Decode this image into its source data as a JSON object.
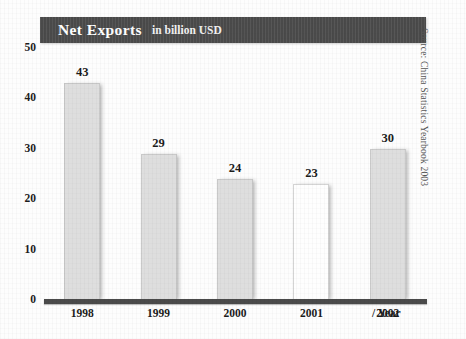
{
  "title": {
    "main": "Net Exports",
    "subtitle": "in billion USD"
  },
  "source_note": "Source: China Statistics Yearbook 2003",
  "x_axis_caption": "/  Year",
  "colors": {
    "banner": "#4e4e4e",
    "bar_gray": "#dedede",
    "bar_white": "#fefefe",
    "baseline": "#4a4a4a",
    "text": "#1c1c1c",
    "page": "#fdfdfd"
  },
  "chart_data": {
    "type": "bar",
    "title": "Net Exports in billion USD",
    "xlabel": "Year",
    "ylabel": "",
    "categories": [
      "1998",
      "1999",
      "2000",
      "2001",
      "2002"
    ],
    "values": [
      43,
      29,
      24,
      23,
      30
    ],
    "bar_shades": [
      "gray",
      "gray",
      "gray",
      "white",
      "gray"
    ],
    "value_labels": [
      "43",
      "29",
      "24",
      "23",
      "30"
    ],
    "ylim": [
      0,
      50
    ],
    "yticks": [
      0,
      10,
      20,
      30,
      40,
      50
    ],
    "ytick_labels": [
      "0",
      "10",
      "20",
      "30",
      "40",
      "50"
    ],
    "grid": false,
    "legend": false
  }
}
